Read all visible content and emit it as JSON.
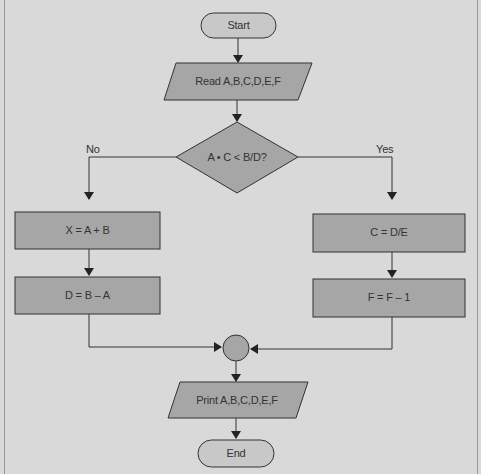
{
  "diagram": {
    "type": "flowchart",
    "top_caption_cropped": "",
    "colors": {
      "background": "#d9d9d9",
      "shape_fill": "#a6a6a6",
      "terminal_fill": "#c8c8c8",
      "stroke": "#333333",
      "text": "#333333"
    },
    "nodes": {
      "start": {
        "label": "Start",
        "shape": "terminal"
      },
      "read": {
        "label": "Read A,B,C,D,E,F",
        "shape": "parallelogram"
      },
      "decision": {
        "label": "A • C < B/D?",
        "shape": "diamond"
      },
      "no_branch": {
        "label": "No"
      },
      "yes_branch": {
        "label": "Yes"
      },
      "x_assign": {
        "label": "X = A + B",
        "shape": "process"
      },
      "d_assign": {
        "label": "D = B – A",
        "shape": "process"
      },
      "c_assign": {
        "label": "C = D/E",
        "shape": "process"
      },
      "f_assign": {
        "label": "F = F – 1",
        "shape": "process"
      },
      "connector": {
        "label": "",
        "shape": "circle"
      },
      "print": {
        "label": "Print A,B,C,D,E,F",
        "shape": "parallelogram"
      },
      "end": {
        "label": "End",
        "shape": "terminal"
      }
    },
    "edges": [
      [
        "start",
        "read"
      ],
      [
        "read",
        "decision"
      ],
      [
        "decision",
        "x_assign",
        "No"
      ],
      [
        "decision",
        "c_assign",
        "Yes"
      ],
      [
        "x_assign",
        "d_assign"
      ],
      [
        "c_assign",
        "f_assign"
      ],
      [
        "d_assign",
        "connector"
      ],
      [
        "f_assign",
        "connector"
      ],
      [
        "connector",
        "print"
      ],
      [
        "print",
        "end"
      ]
    ]
  }
}
